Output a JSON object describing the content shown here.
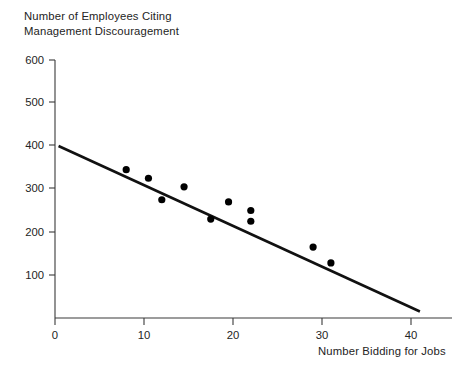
{
  "chart_data": {
    "type": "scatter",
    "title": "Number of Employees Citing\nManagement Discouragement",
    "xlabel": "Number Bidding for Jobs",
    "ylabel": "Number of Employees Citing Management Discouragement",
    "xlim": [
      0,
      45
    ],
    "ylim": [
      0,
      600
    ],
    "xticks": [
      0,
      10,
      20,
      30,
      40
    ],
    "yticks": [
      0,
      100,
      200,
      300,
      400,
      500,
      600
    ],
    "xtick_labels": [
      "0",
      "10",
      "20",
      "30",
      "40"
    ],
    "ytick_labels": [
      "0",
      "100",
      "200",
      "300",
      "400",
      "500",
      "600"
    ],
    "grid": false,
    "legend": false,
    "points": [
      {
        "x": 8.0,
        "y": 345
      },
      {
        "x": 10.5,
        "y": 325
      },
      {
        "x": 12.0,
        "y": 275
      },
      {
        "x": 14.5,
        "y": 305
      },
      {
        "x": 17.5,
        "y": 230
      },
      {
        "x": 19.5,
        "y": 270
      },
      {
        "x": 22.0,
        "y": 250
      },
      {
        "x": 22.0,
        "y": 225
      },
      {
        "x": 29.0,
        "y": 165
      },
      {
        "x": 31.0,
        "y": 128
      }
    ],
    "trend_line": {
      "label": "fitted regression line",
      "x0": 0.4,
      "y0": 400,
      "x1": 41.0,
      "y1": 15
    },
    "marker_color": "#000000",
    "line_color": "#111111",
    "axis_color": "#3a3a3a",
    "background_color": "#ffffff"
  },
  "axes": {
    "title_text": "Number of Employees Citing\nManagement Discouragement",
    "xaxis_title_text": "Number Bidding for Jobs"
  }
}
